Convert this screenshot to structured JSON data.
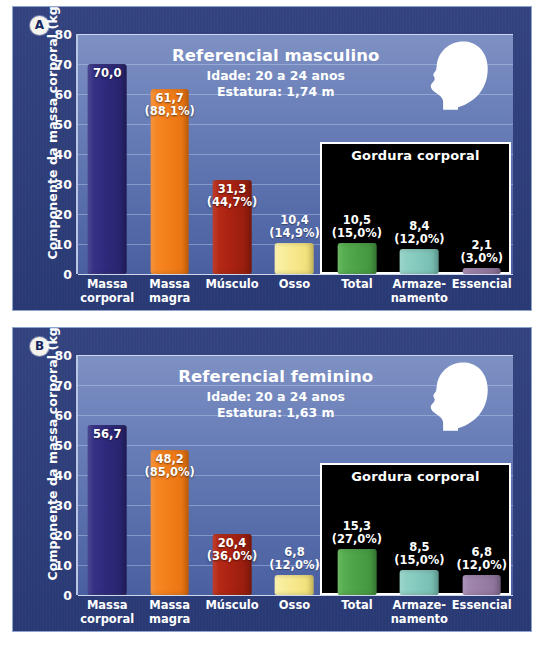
{
  "figure": {
    "y_axis_title": "Componente da massa corporal (kg)",
    "y_ticks": [
      "80",
      "70",
      "60",
      "50",
      "40",
      "30",
      "20",
      "10",
      "0"
    ],
    "fat_box_title": "Gordura corporal"
  },
  "panels": [
    {
      "badge": "A",
      "title": "Referencial masculino",
      "subtitle_age": "Idade: 20 a 24 anos",
      "subtitle_height": "Estatura: 1,74 m",
      "head_icon": "male-head-silhouette-icon",
      "categories": [
        "Massa corporal",
        "Massa magra",
        "Músculo",
        "Osso",
        "Total",
        "Armaze- namento",
        "Essencial"
      ],
      "bars": [
        {
          "label_l1": "Massa",
          "label_l2": "corporal",
          "value": 70.0,
          "value_label": "70,0",
          "pct_label": "",
          "color": "#2e2a7c",
          "style": "navy",
          "label_inside": true
        },
        {
          "label_l1": "Massa",
          "label_l2": "magra",
          "value": 61.7,
          "value_label": "61,7",
          "pct_label": "(88,1%)",
          "color": "#f4801c",
          "style": "orange",
          "label_inside": true
        },
        {
          "label_l1": "Músculo",
          "label_l2": "",
          "value": 31.3,
          "value_label": "31,3",
          "pct_label": "(44,7%)",
          "color": "#ab2211",
          "style": "red",
          "label_inside": true
        },
        {
          "label_l1": "Osso",
          "label_l2": "",
          "value": 10.4,
          "value_label": "10,4",
          "pct_label": "(14,9%)",
          "color": "#f7e98f",
          "style": "yellow",
          "label_inside": false
        },
        {
          "label_l1": "Total",
          "label_l2": "",
          "value": 10.5,
          "value_label": "10,5",
          "pct_label": "(15,0%)",
          "color": "#4da347",
          "style": "green",
          "label_inside": false
        },
        {
          "label_l1": "Armaze-",
          "label_l2": "namento",
          "value": 8.4,
          "value_label": "8,4",
          "pct_label": "(12,0%)",
          "color": "#85c9bd",
          "style": "teal",
          "label_inside": false
        },
        {
          "label_l1": "Essencial",
          "label_l2": "",
          "value": 2.1,
          "value_label": "2,1",
          "pct_label": "(3,0%)",
          "color": "#9a7ea6",
          "style": "purple",
          "label_inside": false
        }
      ]
    },
    {
      "badge": "B",
      "title": "Referencial feminino",
      "subtitle_age": "Idade: 20 a 24 anos",
      "subtitle_height": "Estatura: 1,63 m",
      "head_icon": "female-head-silhouette-icon",
      "categories": [
        "Massa corporal",
        "Massa magra",
        "Músculo",
        "Osso",
        "Total",
        "Armaze- namento",
        "Essencial"
      ],
      "bars": [
        {
          "label_l1": "Massa",
          "label_l2": "corporal",
          "value": 56.7,
          "value_label": "56,7",
          "pct_label": "",
          "color": "#2e2a7c",
          "style": "navy",
          "label_inside": true
        },
        {
          "label_l1": "Massa",
          "label_l2": "magra",
          "value": 48.2,
          "value_label": "48,2",
          "pct_label": "(85,0%)",
          "color": "#f4801c",
          "style": "orange",
          "label_inside": true
        },
        {
          "label_l1": "Músculo",
          "label_l2": "",
          "value": 20.4,
          "value_label": "20,4",
          "pct_label": "(36,0%)",
          "color": "#ab2211",
          "style": "red",
          "label_inside": true
        },
        {
          "label_l1": "Osso",
          "label_l2": "",
          "value": 6.8,
          "value_label": "6,8",
          "pct_label": "(12,0%)",
          "color": "#f7e98f",
          "style": "yellow",
          "label_inside": false
        },
        {
          "label_l1": "Total",
          "label_l2": "",
          "value": 15.3,
          "value_label": "15,3",
          "pct_label": "(27,0%)",
          "color": "#4da347",
          "style": "green",
          "label_inside": false
        },
        {
          "label_l1": "Armaze-",
          "label_l2": "namento",
          "value": 8.5,
          "value_label": "8,5",
          "pct_label": "(15,0%)",
          "color": "#85c9bd",
          "style": "teal",
          "label_inside": false
        },
        {
          "label_l1": "Essencial",
          "label_l2": "",
          "value": 6.8,
          "value_label": "6,8",
          "pct_label": "(12,0%)",
          "color": "#9a7ea6",
          "style": "purple",
          "label_inside": false
        }
      ]
    }
  ],
  "chart_data": [
    {
      "type": "bar",
      "title": "Referencial masculino",
      "subtitle": "Idade: 20 a 24 anos; Estatura: 1,74 m",
      "xlabel": "",
      "ylabel": "Componente da massa corporal (kg)",
      "ylim": [
        0,
        80
      ],
      "yticks": [
        0,
        10,
        20,
        30,
        40,
        50,
        60,
        70,
        80
      ],
      "grid": true,
      "legend": "none",
      "categories": [
        "Massa corporal",
        "Massa magra",
        "Músculo",
        "Osso",
        "Total",
        "Armazenamento",
        "Essencial"
      ],
      "values": [
        70.0,
        61.7,
        31.3,
        10.4,
        10.5,
        8.4,
        2.1
      ],
      "percent_labels": [
        "",
        "88,1%",
        "44,7%",
        "14,9%",
        "15,0%",
        "12,0%",
        "3,0%"
      ],
      "bar_colors": [
        "#2e2a7c",
        "#f4801c",
        "#ab2211",
        "#f7e98f",
        "#4da347",
        "#85c9bd",
        "#9a7ea6"
      ],
      "annotations": [
        "Gordura corporal (Total, Armazenamento, Essencial)"
      ]
    },
    {
      "type": "bar",
      "title": "Referencial feminino",
      "subtitle": "Idade: 20 a 24 anos; Estatura: 1,63 m",
      "xlabel": "",
      "ylabel": "Componente da massa corporal (kg)",
      "ylim": [
        0,
        80
      ],
      "yticks": [
        0,
        10,
        20,
        30,
        40,
        50,
        60,
        70,
        80
      ],
      "grid": true,
      "legend": "none",
      "categories": [
        "Massa corporal",
        "Massa magra",
        "Músculo",
        "Osso",
        "Total",
        "Armazenamento",
        "Essencial"
      ],
      "values": [
        56.7,
        48.2,
        20.4,
        6.8,
        15.3,
        8.5,
        6.8
      ],
      "percent_labels": [
        "",
        "85,0%",
        "36,0%",
        "12,0%",
        "27,0%",
        "15,0%",
        "12,0%"
      ],
      "bar_colors": [
        "#2e2a7c",
        "#f4801c",
        "#ab2211",
        "#f7e98f",
        "#4da347",
        "#85c9bd",
        "#9a7ea6"
      ],
      "annotations": [
        "Gordura corporal (Total, Armazenamento, Essencial)"
      ]
    }
  ]
}
